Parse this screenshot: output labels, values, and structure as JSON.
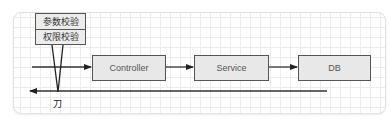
{
  "diagram": {
    "labels": [
      "参数校验",
      "权限校验"
    ],
    "nodes": [
      {
        "id": "controller",
        "label": "Controller"
      },
      {
        "id": "service",
        "label": "Service"
      },
      {
        "id": "db",
        "label": "DB"
      }
    ],
    "knife_label": "刀",
    "colors": {
      "box_fill": "#e8e8e8",
      "box_border": "#555555",
      "line": "#333333",
      "grid": "#ececec"
    }
  }
}
